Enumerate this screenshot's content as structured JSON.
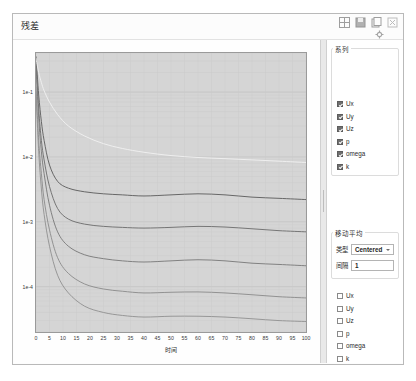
{
  "window": {
    "title": "残差",
    "toolbar": [
      {
        "name": "grid-layout-icon",
        "glyph": "grid"
      },
      {
        "name": "save-image-icon",
        "glyph": "save"
      },
      {
        "name": "copy-icon",
        "glyph": "copy"
      },
      {
        "name": "close-icon",
        "glyph": "close"
      },
      {
        "name": "settings-icon",
        "glyph": "gear"
      }
    ]
  },
  "chart_data": {
    "type": "line",
    "title": "",
    "xlabel": "时间",
    "ylabel": "",
    "xlim": [
      0,
      100
    ],
    "ylim": [
      2e-05,
      0.4
    ],
    "yscale": "log",
    "grid": true,
    "xticks": [
      0,
      5,
      10,
      15,
      20,
      25,
      30,
      35,
      40,
      45,
      50,
      55,
      60,
      65,
      70,
      75,
      80,
      85,
      90,
      95,
      100
    ],
    "yticks": [
      "1e-1",
      "1e-2",
      "1e-3",
      "1e-4"
    ],
    "ytick_values": [
      0.1,
      0.01,
      0.001,
      0.0001
    ],
    "legend_position": "none",
    "series": [
      {
        "name": "Ux",
        "color": "#5a5a5a",
        "x": [
          0,
          1,
          2,
          3,
          5,
          8,
          12,
          18,
          25,
          32,
          40,
          50,
          60,
          70,
          80,
          90,
          100
        ],
        "values": [
          0.35,
          0.09,
          0.035,
          0.018,
          0.0075,
          0.0042,
          0.0033,
          0.0029,
          0.0027,
          0.0026,
          0.0025,
          0.0026,
          0.0027,
          0.0026,
          0.0024,
          0.0023,
          0.0022
        ]
      },
      {
        "name": "Uy",
        "color": "#6b6b6b",
        "x": [
          0,
          1,
          2,
          3,
          5,
          8,
          12,
          18,
          25,
          32,
          40,
          50,
          60,
          70,
          80,
          90,
          100
        ],
        "values": [
          0.3,
          0.055,
          0.018,
          0.009,
          0.0035,
          0.0016,
          0.0011,
          0.00092,
          0.00085,
          0.00082,
          0.0008,
          0.00082,
          0.00085,
          0.00083,
          0.00078,
          0.00073,
          0.0007
        ]
      },
      {
        "name": "Uz",
        "color": "#777777",
        "x": [
          0,
          1,
          2,
          3,
          5,
          8,
          12,
          18,
          25,
          32,
          40,
          50,
          60,
          70,
          80,
          90,
          100
        ],
        "values": [
          0.28,
          0.04,
          0.012,
          0.0055,
          0.0018,
          0.0007,
          0.00042,
          0.00031,
          0.00027,
          0.00025,
          0.00024,
          0.00025,
          0.00026,
          0.00025,
          0.00023,
          0.00022,
          0.00021
        ]
      },
      {
        "name": "p",
        "color": "#f2f2f2",
        "x": [
          0,
          1,
          2,
          3,
          5,
          8,
          12,
          18,
          25,
          32,
          40,
          50,
          60,
          70,
          80,
          90,
          100
        ],
        "values": [
          0.33,
          0.2,
          0.14,
          0.105,
          0.07,
          0.045,
          0.03,
          0.021,
          0.016,
          0.0135,
          0.0118,
          0.0105,
          0.0098,
          0.0094,
          0.009,
          0.0086,
          0.0082
        ]
      },
      {
        "name": "omega",
        "color": "#8a8a8a",
        "x": [
          0,
          1,
          2,
          3,
          5,
          8,
          12,
          18,
          25,
          32,
          40,
          50,
          60,
          70,
          80,
          90,
          100
        ],
        "values": [
          0.12,
          0.018,
          0.0055,
          0.0022,
          0.00075,
          0.00028,
          0.00016,
          0.00011,
          9.2e-05,
          8.5e-05,
          8e-05,
          8.2e-05,
          8.3e-05,
          8e-05,
          7.5e-05,
          7e-05,
          6.7e-05
        ]
      },
      {
        "name": "k",
        "color": "#909090",
        "x": [
          0,
          1,
          2,
          3,
          5,
          8,
          12,
          18,
          25,
          32,
          40,
          50,
          60,
          70,
          80,
          90,
          100
        ],
        "values": [
          0.1,
          0.012,
          0.0032,
          0.0013,
          0.00042,
          0.00015,
          8e-05,
          5e-05,
          4e-05,
          3.6e-05,
          3.4e-05,
          3.5e-05,
          3.5e-05,
          3.4e-05,
          3.2e-05,
          3e-05,
          2.9e-05
        ]
      }
    ]
  },
  "sidebar": {
    "series_group": {
      "title": "系列",
      "items": [
        {
          "label": "Ux",
          "checked": true
        },
        {
          "label": "Uy",
          "checked": true
        },
        {
          "label": "Uz",
          "checked": true
        },
        {
          "label": "p",
          "checked": true
        },
        {
          "label": "omega",
          "checked": true
        },
        {
          "label": "k",
          "checked": true
        }
      ]
    },
    "moving_average": {
      "title": "移动平均",
      "type_label": "类型",
      "type_value": "Centered",
      "interval_label": "间隔",
      "interval_value": "1"
    },
    "second_list": {
      "items": [
        {
          "label": "Ux",
          "checked": false
        },
        {
          "label": "Uy",
          "checked": false
        },
        {
          "label": "Uz",
          "checked": false
        },
        {
          "label": "p",
          "checked": false
        },
        {
          "label": "omega",
          "checked": false
        },
        {
          "label": "k",
          "checked": false
        }
      ]
    }
  }
}
